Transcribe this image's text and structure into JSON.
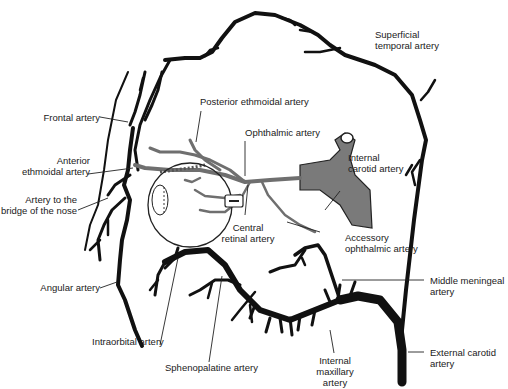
{
  "diagram": {
    "type": "anatomical illustration",
    "colors": {
      "external_carotid_branches": "#111111",
      "internal_carotid_branches": "#6f6f6f",
      "background": "#ffffff",
      "text": "#1a1a1a"
    }
  },
  "labels": {
    "superficial_temporal": [
      "Superficial",
      "temporal artery"
    ],
    "posterior_ethmoidal": "Posterior ethmoidal artery",
    "frontal": "Frontal artery",
    "ophthalmic": "Ophthalmic artery",
    "anterior_ethmoidal": [
      "Anterior",
      "ethmoidal artery"
    ],
    "internal_carotid": [
      "Internal",
      "carotid artery"
    ],
    "bridge_of_nose": [
      "Artery to the",
      "bridge of the nose"
    ],
    "central_retinal": [
      "Central",
      "retinal artery"
    ],
    "accessory_ophthalmic": [
      "Accessory",
      "ophthalmic artery"
    ],
    "angular": "Angular artery",
    "middle_meningeal": [
      "Middle meningeal",
      "artery"
    ],
    "intraorbital": "Intraorbital artery",
    "sphenopalatine": "Sphenopalatine artery",
    "internal_maxillary": [
      "Internal",
      "maxillary",
      "artery"
    ],
    "external_carotid": [
      "External carotid",
      "artery"
    ]
  }
}
